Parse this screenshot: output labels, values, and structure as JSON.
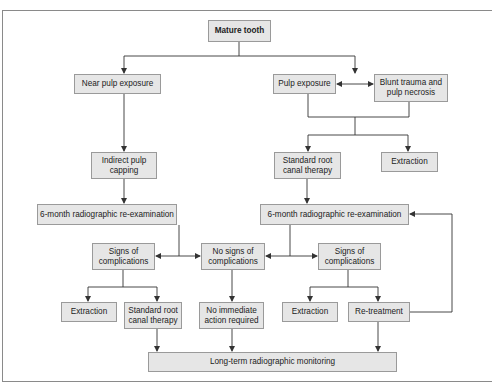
{
  "diagram": {
    "type": "flowchart",
    "nodes": {
      "mature_tooth": "Mature tooth",
      "near_pulp_exposure": "Near pulp exposure",
      "pulp_exposure": "Pulp exposure",
      "blunt_trauma": "Blunt trauma and\npulp necrosis",
      "indirect_pulp_capping": "Indirect pulp\ncapping",
      "standard_root_canal_top": "Standard root\ncanal therapy",
      "extraction_top": "Extraction",
      "reexam_left": "6-month radiographic re-examination",
      "reexam_right": "6-month radiographic re-examination",
      "signs_left": "Signs of\ncomplications",
      "no_signs": "No signs of\ncomplications",
      "signs_right": "Signs of\ncomplications",
      "extraction_left": "Extraction",
      "standard_root_canal_bottom": "Standard root\ncanal therapy",
      "no_action": "No immediate\naction required",
      "extraction_right": "Extraction",
      "retreatment": "Re-treatment",
      "long_term": "Long-term radiographic monitoring"
    },
    "edges": [
      [
        "mature_tooth",
        "near_pulp_exposure"
      ],
      [
        "mature_tooth",
        "pulp_exposure/blunt_trauma"
      ],
      [
        "near_pulp_exposure",
        "indirect_pulp_capping"
      ],
      [
        "indirect_pulp_capping",
        "reexam_left"
      ],
      [
        "pulp_exposure",
        "standard_root_canal_top"
      ],
      [
        "blunt_trauma",
        "standard_root_canal_top"
      ],
      [
        "pulp_exposure/blunt_trauma",
        "extraction_top"
      ],
      [
        "standard_root_canal_top",
        "reexam_right"
      ],
      [
        "reexam_left",
        "signs_left"
      ],
      [
        "reexam_left",
        "no_signs"
      ],
      [
        "reexam_right",
        "no_signs"
      ],
      [
        "reexam_right",
        "signs_right"
      ],
      [
        "signs_left",
        "extraction_left"
      ],
      [
        "signs_left",
        "standard_root_canal_bottom"
      ],
      [
        "no_signs",
        "no_action"
      ],
      [
        "signs_right",
        "extraction_right"
      ],
      [
        "signs_right",
        "retreatment"
      ],
      [
        "retreatment",
        "reexam_right"
      ],
      [
        "standard_root_canal_bottom",
        "long_term"
      ],
      [
        "no_action",
        "long_term"
      ],
      [
        "retreatment",
        "long_term"
      ]
    ],
    "colors": {
      "box_fill": "#e6e6e6",
      "box_border": "#9a9a9a",
      "line": "#333333"
    }
  }
}
